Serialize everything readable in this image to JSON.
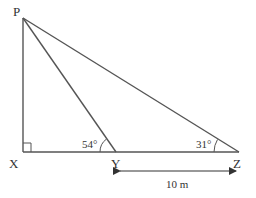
{
  "diagram": {
    "type": "geometry-triangle",
    "points": {
      "P": {
        "label": "P",
        "x": 23,
        "y": 18
      },
      "X": {
        "label": "X",
        "x": 23,
        "y": 152
      },
      "Y": {
        "label": "Y",
        "x": 116,
        "y": 152
      },
      "Z": {
        "label": "Z",
        "x": 239,
        "y": 152
      }
    },
    "angles": {
      "PYX": "54°",
      "PZY": "31°",
      "PXY": "right-angle"
    },
    "measure": {
      "label": "10 m",
      "from": "Y",
      "to": "Z"
    },
    "colors": {
      "line": "#555555",
      "text": "#333333"
    }
  }
}
